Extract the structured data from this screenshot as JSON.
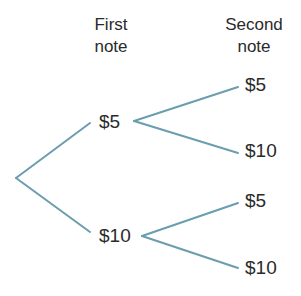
{
  "diagram": {
    "type": "tree-diagram",
    "headers": {
      "first_line1": "First",
      "first_line2": "note",
      "second_line1": "Second",
      "second_line2": "note"
    },
    "colors": {
      "line": "#6a9dae",
      "text": "#2a2a2a"
    },
    "first_notes": [
      {
        "label": "$5",
        "second_notes": [
          "$5",
          "$10"
        ]
      },
      {
        "label": "$10",
        "second_notes": [
          "$5",
          "$10"
        ]
      }
    ]
  }
}
